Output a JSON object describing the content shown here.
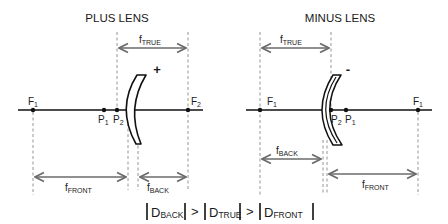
{
  "plus_lens": {
    "title": "PLUS LENS",
    "sign": "+",
    "points": {
      "f1": {
        "main": "F",
        "sub": "1"
      },
      "p1": {
        "main": "P",
        "sub": "1"
      },
      "p2": {
        "main": "P",
        "sub": "2"
      },
      "f2": {
        "main": "F",
        "sub": "2"
      }
    },
    "distances": {
      "true": {
        "main": "f",
        "sub": "TRUE"
      },
      "front": {
        "main": "f",
        "sub": "FRONT"
      },
      "back": {
        "main": "f",
        "sub": "BACK"
      }
    }
  },
  "minus_lens": {
    "title": "MINUS LENS",
    "sign": "-",
    "points": {
      "f1_left": {
        "main": "F",
        "sub": "1"
      },
      "p2": {
        "main": "P",
        "sub": "2"
      },
      "p1": {
        "main": "P",
        "sub": "1"
      },
      "f1_right": {
        "main": "F",
        "sub": "1"
      }
    },
    "distances": {
      "true": {
        "main": "f",
        "sub": "TRUE"
      },
      "back": {
        "main": "f",
        "sub": "BACK"
      },
      "front": {
        "main": "f",
        "sub": "FRONT"
      }
    }
  },
  "formula": {
    "terms": [
      {
        "main": "D",
        "sub": "BACK"
      },
      {
        "main": "D",
        "sub": "TRUE"
      },
      {
        "main": "D",
        "sub": "FRONT"
      }
    ],
    "operator": ">",
    "bar": "|"
  },
  "colors": {
    "line": "#111111",
    "arrow": "#6b6b6b",
    "dash": "#8a8a8a"
  }
}
